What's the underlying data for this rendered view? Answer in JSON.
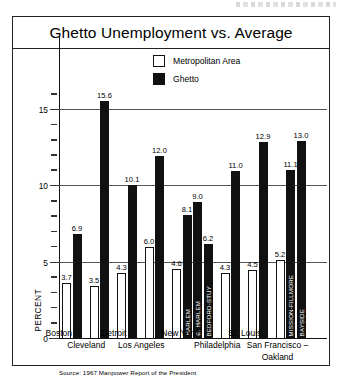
{
  "chart": {
    "title": "Ghetto Unemployment vs. Average",
    "source": "Source: 1967 Manpower Report of the President",
    "ylabel": "PERCENT",
    "legend": [
      {
        "key": "metro",
        "label": "Metropolitan Area",
        "color": "#ffffff"
      },
      {
        "key": "ghetto",
        "label": "Ghetto",
        "color": "#111111"
      }
    ]
  },
  "chart_data": {
    "type": "bar",
    "title": "Ghetto Unemployment vs. Average",
    "xlabel": "",
    "ylabel": "PERCENT",
    "ylim": [
      0,
      16
    ],
    "yticks_major": [
      0,
      5,
      10,
      15
    ],
    "ytick_step_minor": 1,
    "grid": true,
    "legend_position": "top-center",
    "annotation": "Source: 1967 Manpower Report of the President",
    "categories": [
      "Boston",
      "Cleveland",
      "Detroit",
      "Los Angeles",
      "New York",
      "Philadelphia",
      "St. Louis",
      "San Francisco-Oakland"
    ],
    "series": [
      {
        "name": "Metropolitan Area",
        "values": [
          3.7,
          3.5,
          4.3,
          6.0,
          4.6,
          4.3,
          4.5,
          5.2
        ]
      },
      {
        "name": "Ghetto",
        "values": [
          6.9,
          15.6,
          10.1,
          12.0,
          null,
          11.0,
          12.9,
          null
        ]
      }
    ],
    "groups": [
      {
        "city": "Boston",
        "metro": 3.7,
        "ghetto_bars": [
          {
            "label": "",
            "value": 6.9
          }
        ]
      },
      {
        "city": "Cleveland",
        "metro": 3.5,
        "ghetto_bars": [
          {
            "label": "",
            "value": 15.6
          }
        ]
      },
      {
        "city": "Detroit",
        "metro": 4.3,
        "ghetto_bars": [
          {
            "label": "",
            "value": 10.1
          }
        ]
      },
      {
        "city": "Los Angeles",
        "metro": 6.0,
        "ghetto_bars": [
          {
            "label": "",
            "value": 12.0
          }
        ]
      },
      {
        "city": "New York",
        "metro": 4.6,
        "ghetto_bars": [
          {
            "label": "HARLEM",
            "value": 8.1
          },
          {
            "label": "E. HARLEM",
            "value": 9.0
          },
          {
            "label": "BEDFORD-STUY",
            "value": 6.2
          }
        ]
      },
      {
        "city": "Philadelphia",
        "metro": 4.3,
        "ghetto_bars": [
          {
            "label": "",
            "value": 11.0
          }
        ]
      },
      {
        "city": "St. Louis",
        "metro": 4.5,
        "ghetto_bars": [
          {
            "label": "",
            "value": 12.9
          }
        ]
      },
      {
        "city": "San Francisco-Oakland",
        "metro": 5.2,
        "ghetto_bars": [
          {
            "label": "MISSION-FILLMORE",
            "value": 11.1
          },
          {
            "label": "BAYSIDE",
            "value": 13.0
          }
        ]
      }
    ],
    "city_label_lines": [
      {
        "text": "Boston",
        "row": 0
      },
      {
        "text": "Cleveland",
        "row": 1
      },
      {
        "text": "Detroit",
        "row": 0
      },
      {
        "text": "Los Angeles",
        "row": 1
      },
      {
        "text": "New York",
        "row": 0
      },
      {
        "text": "Philadelphia",
        "row": 1
      },
      {
        "text": "St. Louis",
        "row": 0
      },
      {
        "text": "San Francisco –",
        "row": 1
      },
      {
        "text": "Oakland",
        "row": 2
      }
    ]
  }
}
